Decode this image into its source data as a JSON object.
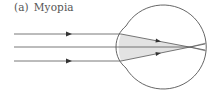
{
  "figure": {
    "label": "(a)",
    "title": "Myopia"
  },
  "diagram": {
    "stroke_color": "#555555",
    "lens_fill": "#e3e3e3",
    "rays": [
      {
        "y": 34,
        "arrow": true
      },
      {
        "y": 47,
        "arrow": false
      },
      {
        "y": 61,
        "arrow": true
      }
    ],
    "focal_point": {
      "x": 190,
      "y": 47
    }
  }
}
